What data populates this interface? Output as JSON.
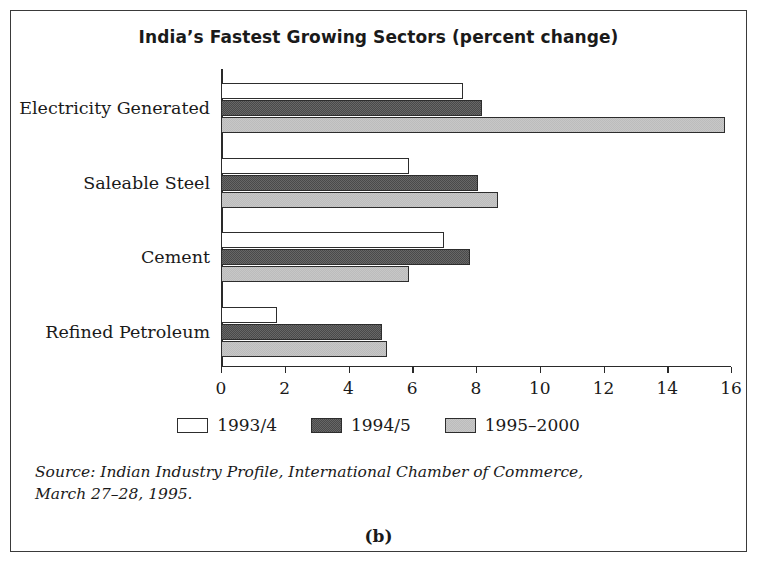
{
  "figure": {
    "caption": "(b)",
    "source_line_1": "Source: Indian Industry Profile, International Chamber of Commerce,",
    "source_line_2": "March 27–28, 1995."
  },
  "chart_data": {
    "type": "bar",
    "orientation": "horizontal",
    "title": "India’s Fastest Growing Sectors (percent change)",
    "xlabel": "",
    "ylabel": "",
    "xlim": [
      0,
      16
    ],
    "xticks": [
      0,
      2,
      4,
      6,
      8,
      10,
      12,
      14,
      16
    ],
    "xtick_labels": [
      "0",
      "2",
      "4",
      "6",
      "8",
      "10",
      "12",
      "14",
      "16"
    ],
    "grid": false,
    "legend_position": "bottom",
    "categories": [
      "Electricity Generated",
      "Saleable Steel",
      "Cement",
      "Refined Petroleum"
    ],
    "series": [
      {
        "name": "1993/4",
        "color": "#ffffff",
        "values": [
          7.6,
          5.9,
          7.0,
          1.75
        ]
      },
      {
        "name": "1994/5",
        "color": "#4a4a4a",
        "values": [
          8.2,
          8.05,
          7.8,
          5.05
        ]
      },
      {
        "name": "1995–2000",
        "color": "#bcbcbc",
        "values": [
          15.8,
          8.7,
          5.9,
          5.2
        ]
      }
    ]
  }
}
